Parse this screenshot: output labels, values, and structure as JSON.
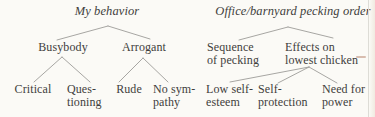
{
  "left_tree": {
    "title": "My behavior",
    "level1": [
      {
        "label": "Busybody"
      },
      {
        "label": "Arrogant"
      }
    ],
    "leaves": [
      {
        "label": "Critical"
      },
      {
        "label": "Ques-\ntioning"
      },
      {
        "label": "Rude"
      },
      {
        "label": "No sym-\npathy"
      }
    ]
  },
  "right_tree": {
    "title": "Office/barnyard pecking order",
    "level1": [
      {
        "label": "Sequence\nof pecking"
      },
      {
        "label": "Effects on\nlowest chicken"
      }
    ],
    "leaves": [
      {
        "label": "Low self-\nesteem"
      },
      {
        "label": "Self-\nprotection"
      },
      {
        "label": "Need for\npower"
      }
    ]
  },
  "colors": {
    "text": "#3f3e3c",
    "line": "#9d9c98",
    "background": "#fbfaf6"
  }
}
